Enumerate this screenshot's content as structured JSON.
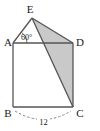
{
  "figure": {
    "background_color": "#ffffff",
    "stroke_color": "#555555",
    "shade_color": "#c9c9c9",
    "label_color": "#1a1a1a",
    "vertices": [
      {
        "name": "E",
        "label": "E",
        "x": 32,
        "y": 18,
        "label_x": 30,
        "label_y": 13
      },
      {
        "name": "A",
        "label": "A",
        "x": 13,
        "y": 43,
        "label_x": 8,
        "label_y": 45
      },
      {
        "name": "D",
        "label": "D",
        "x": 73,
        "y": 43,
        "label_x": 79,
        "label_y": 45
      },
      {
        "name": "B",
        "label": "B",
        "x": 13,
        "y": 107,
        "label_x": 7,
        "label_y": 116
      },
      {
        "name": "C",
        "label": "C",
        "x": 73,
        "y": 107,
        "label_x": 79,
        "label_y": 116
      }
    ],
    "edges": [
      {
        "name": "edge-A-E",
        "from": "A",
        "to": "E"
      },
      {
        "name": "edge-E-D",
        "from": "E",
        "to": "D"
      },
      {
        "name": "edge-A-D",
        "from": "A",
        "to": "D"
      },
      {
        "name": "edge-A-B",
        "from": "A",
        "to": "B"
      },
      {
        "name": "edge-D-C",
        "from": "D",
        "to": "C"
      },
      {
        "name": "edge-B-C",
        "from": "B",
        "to": "C"
      },
      {
        "name": "edge-E-C",
        "from": "E",
        "to": "C"
      }
    ],
    "shaded_region": {
      "name": "shaded-triangle-EDC",
      "vertices": [
        "E",
        "D",
        "C"
      ],
      "fill": "#c9c9c9"
    },
    "angle": {
      "name": "angle-at-A",
      "value": "60",
      "unit": "°",
      "text": "60°",
      "vertex": "A",
      "between": [
        "AE",
        "AD"
      ],
      "label_x": 21,
      "label_y": 39
    },
    "dimension": {
      "name": "dimension-BC",
      "text": "12",
      "from": "B",
      "to": "C",
      "style": "dashed-arc",
      "label_x": 43,
      "label_y": 124
    }
  }
}
